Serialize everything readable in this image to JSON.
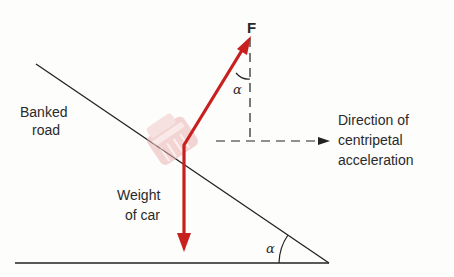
{
  "diagram": {
    "type": "free-body diagram",
    "labels": {
      "banked_road": [
        "Banked",
        "road"
      ],
      "weight": [
        "Weight",
        "of car"
      ],
      "force": "F",
      "alpha_top": "α",
      "alpha_bottom": "α",
      "centripetal": [
        "Direction of",
        "centripetal",
        "acceleration"
      ]
    },
    "colors": {
      "force_arrow": "#c8201e",
      "lines": "#222222",
      "car": "#efc3c3",
      "background": "#fdfdfb"
    }
  }
}
